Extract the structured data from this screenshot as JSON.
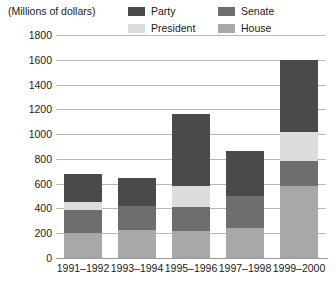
{
  "axis_caption": "(Millions of dollars)",
  "legend": {
    "items": [
      {
        "label": "Party",
        "color": "#4a4a4a"
      },
      {
        "label": "Senate",
        "color": "#6e6e6e"
      },
      {
        "label": "President",
        "color": "#dcdcdc"
      },
      {
        "label": "House",
        "color": "#a8a8a8"
      }
    ]
  },
  "chart_data": {
    "type": "bar",
    "stacked": true,
    "title": "",
    "subtitle": "",
    "xlabel": "",
    "ylabel": "(Millions of dollars)",
    "ylim": [
      0,
      1800
    ],
    "ytick_step": 200,
    "yticks": [
      1800,
      1600,
      1400,
      1200,
      1000,
      800,
      600,
      400,
      200,
      0
    ],
    "ytick_labels": [
      "1800",
      "1600",
      "1400",
      "1200",
      "1000",
      "800",
      "600",
      "400",
      "200",
      "0"
    ],
    "grid": true,
    "grid_axis": "y",
    "legend_position": "top",
    "categories": [
      "1991–1992",
      "1993–1994",
      "1995–1996",
      "1997–1998",
      "1999–2000"
    ],
    "stack_order_bottom_to_top": [
      "House",
      "Senate",
      "President",
      "Party"
    ],
    "series": [
      {
        "name": "House",
        "color": "#a8a8a8",
        "values": [
          200,
          230,
          220,
          240,
          580
        ]
      },
      {
        "name": "Senate",
        "color": "#6e6e6e",
        "values": [
          190,
          190,
          190,
          260,
          200
        ]
      },
      {
        "name": "President",
        "color": "#dcdcdc",
        "values": [
          60,
          0,
          170,
          0,
          240
        ]
      },
      {
        "name": "Party",
        "color": "#4a4a4a",
        "values": [
          230,
          230,
          580,
          360,
          580
        ]
      }
    ],
    "totals": [
      680,
      650,
      1160,
      860,
      1600
    ]
  }
}
